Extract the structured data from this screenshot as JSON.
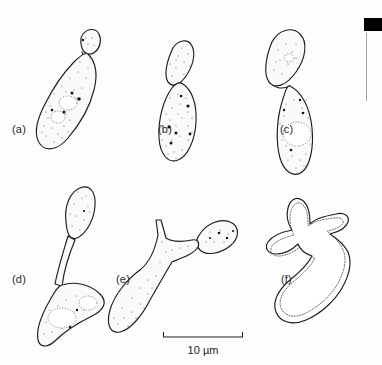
{
  "figure": {
    "kind": "line-drawing-plate",
    "background_color": "#fdfdfd",
    "ink_color": "#1d1d1d",
    "panel_count": 6
  },
  "panels": [
    {
      "label": "(a)",
      "label_x": 12,
      "label_y": 133,
      "form": "ellipsoidal mother cell with single small terminal bud",
      "cytoplasm": "stippled",
      "vacuole_count": 2,
      "granule_count": 5
    },
    {
      "label": "(b)",
      "label_x": 158,
      "label_y": 133,
      "form": "elongate mother cell with large attached daughter cell at constricted neck",
      "cytoplasm": "stippled",
      "vacuole_count": 0,
      "granule_count": 6
    },
    {
      "label": "(c)",
      "label_x": 280,
      "label_y": 133,
      "form": "two elongate cells joined end to end, lower cell with large central vacuole",
      "cytoplasm": "stippled",
      "vacuole_count": 2,
      "granule_count": 4
    },
    {
      "label": "(d)",
      "label_x": 12,
      "label_y": 283,
      "form": "irregular basal cell bearing a long narrow germ tube with swollen apex",
      "cytoplasm": "stippled",
      "vacuole_count": 2,
      "granule_count": 3
    },
    {
      "label": "(e)",
      "label_x": 116,
      "label_y": 283,
      "form": "elongate cell with short lateral spur and an attached ovoid daughter cell",
      "cytoplasm": "stippled",
      "vacuole_count": 0,
      "granule_count": 4
    },
    {
      "label": "(f)",
      "label_x": 281,
      "label_y": 283,
      "form": "stellate multi-lobed cell with several tapering projections, unstippled double outline",
      "cytoplasm": "plain double outline",
      "vacuole_count": 0,
      "granule_count": 0
    }
  ],
  "scale_bar": {
    "label": "10 µm",
    "label_x": 203,
    "label_y": 354,
    "x_start": 163,
    "x_end": 243,
    "y": 337,
    "tick_height": 5,
    "represents_micrometres": 10
  },
  "page_edge_artifact": {
    "present": true,
    "block_x": 364,
    "block_y": 18,
    "block_width": 18,
    "block_height": 13,
    "rule_x": 366,
    "rule_y_start": 33,
    "rule_y_end": 101,
    "color": "#000000"
  }
}
